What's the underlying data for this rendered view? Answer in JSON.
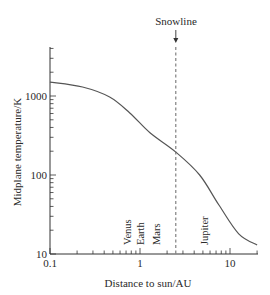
{
  "chart_data": {
    "type": "line",
    "title": "",
    "xlabel": "Distance to sun/AU",
    "ylabel": "Midplane temperature/K",
    "xscale": "log",
    "yscale": "log",
    "xlim": [
      0.1,
      20
    ],
    "ylim": [
      10,
      4000
    ],
    "grid": false,
    "x_ticks": [
      "0.1",
      "1",
      "10"
    ],
    "y_ticks": [
      "10",
      "100",
      "1000"
    ],
    "series": [
      {
        "name": "Midplane temperature",
        "x": [
          0.1,
          0.23,
          0.46,
          0.77,
          1.3,
          2.5,
          4.6,
          7.5,
          12.5,
          20
        ],
        "y": [
          1500,
          1300,
          970,
          610,
          340,
          195,
          100,
          42,
          18,
          13
        ]
      }
    ],
    "annotations": [
      {
        "type": "vline",
        "x": 2.5,
        "style": "dashed",
        "label": "Snowline",
        "arrow": true
      },
      {
        "type": "text",
        "x": 0.72,
        "label": "Venus",
        "rotation": -90
      },
      {
        "type": "text",
        "x": 1.0,
        "label": "Earth",
        "rotation": -90
      },
      {
        "type": "text",
        "x": 1.52,
        "label": "Mars",
        "rotation": -90
      },
      {
        "type": "text",
        "x": 5.2,
        "label": "Jupiter",
        "rotation": -90
      }
    ]
  },
  "labels": {
    "xlabel": "Distance to sun/AU",
    "ylabel": "Midplane temperature/K",
    "snowline": "Snowline",
    "x_ticks": [
      "0.1",
      "1",
      "10"
    ],
    "y_ticks": [
      "10",
      "100",
      "1000"
    ],
    "planets": [
      "Venus",
      "Earth",
      "Mars",
      "Jupiter"
    ]
  },
  "colors": {
    "line": "#555555",
    "axis": "#333333",
    "text": "#2a2a2a"
  }
}
